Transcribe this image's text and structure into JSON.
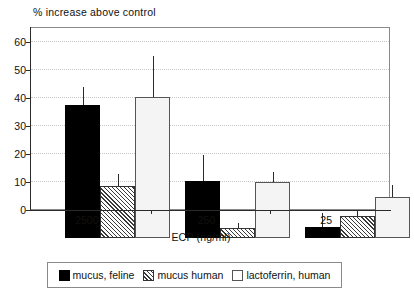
{
  "chart_data": {
    "type": "bar",
    "title": "% increase above control",
    "xlabel": "ECP (ng/ml)",
    "ylabel": "",
    "categories": [
      "2500",
      "250",
      "25"
    ],
    "ylim": [
      0,
      65
    ],
    "yticks": [
      0,
      10,
      20,
      30,
      40,
      50,
      60
    ],
    "ytick_labels": [
      "0",
      "10",
      "20",
      "30",
      "40",
      "50",
      "60"
    ],
    "grid": true,
    "legend_position": "below",
    "series": [
      {
        "name": "mucus, feline",
        "pattern": "solid-black",
        "color": "#000000",
        "values": [
          47.5,
          20.5,
          4.0
        ],
        "errors_upper": [
          54.0,
          29.5,
          9.0
        ]
      },
      {
        "name": "mucus human",
        "pattern": "diagonal-hatch",
        "color": "#ffffff",
        "values": [
          18.5,
          3.5,
          8.0
        ],
        "errors_upper": [
          23.0,
          5.5,
          10.0
        ]
      },
      {
        "name": "lactoferrin, human",
        "pattern": "fine-dots",
        "color": "#f4f4f4",
        "values": [
          50.5,
          20.0,
          14.5
        ],
        "errors_upper": [
          65.0,
          23.5,
          19.0
        ]
      }
    ]
  },
  "legend": {
    "items": [
      {
        "label": "mucus, feline"
      },
      {
        "label": "mucus human"
      },
      {
        "label": "lactoferrin, human"
      }
    ]
  }
}
